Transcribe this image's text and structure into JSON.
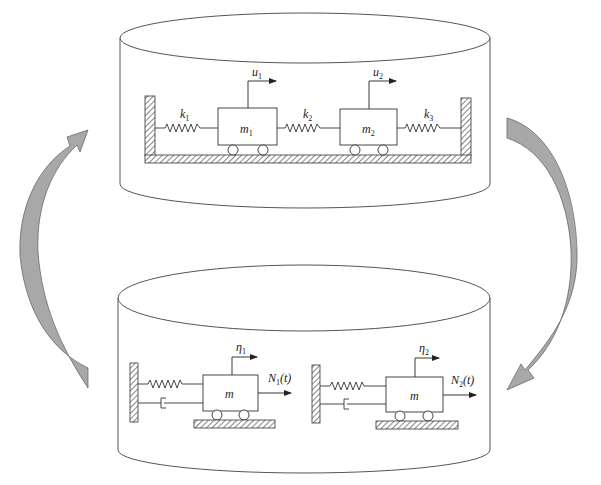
{
  "colors": {
    "stroke": "#555555",
    "line": "#333333",
    "arrow_fill": "#a8a8a8",
    "arrow_stroke": "#6a6a6a",
    "hatch": "#444444",
    "background": "#ffffff"
  },
  "top_system": {
    "description": "Coupled two-degree-of-freedom spring-mass system",
    "springs": [
      {
        "label": "k",
        "sub": "1"
      },
      {
        "label": "k",
        "sub": "2"
      },
      {
        "label": "k",
        "sub": "3"
      }
    ],
    "masses": [
      {
        "label": "m",
        "sub": "1"
      },
      {
        "label": "m",
        "sub": "2"
      }
    ],
    "displacements": [
      {
        "label": "u",
        "sub": "1"
      },
      {
        "label": "u",
        "sub": "2"
      }
    ]
  },
  "bottom_system": {
    "description": "Decoupled single-degree-of-freedom modal oscillators",
    "oscillators": [
      {
        "mass": "m",
        "coord": "η",
        "coord_sub": "1",
        "force": "N",
        "force_sub": "1",
        "force_arg": "(t)"
      },
      {
        "mass": "m",
        "coord": "η",
        "coord_sub": "2",
        "force": "N",
        "force_sub": "2",
        "force_arg": "(t)"
      }
    ]
  },
  "arrows": {
    "left": "bottom-to-top transformation arrow",
    "right": "top-to-bottom transformation arrow"
  }
}
